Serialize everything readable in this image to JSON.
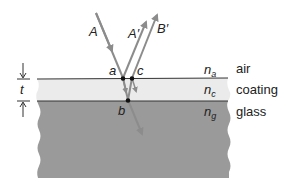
{
  "figure": {
    "rays": {
      "incident": "A",
      "reflected_top": "A′",
      "reflected_bottom": "B′"
    },
    "points": {
      "a": "a",
      "b": "b",
      "c": "c"
    },
    "thickness_label": "t",
    "layers": [
      {
        "name": "air",
        "index_symbol": "n",
        "index_subscript": "a"
      },
      {
        "name": "coating",
        "index_symbol": "n",
        "index_subscript": "c"
      },
      {
        "name": "glass",
        "index_symbol": "n",
        "index_subscript": "g"
      }
    ],
    "colors": {
      "coating_fill": "#ebebeb",
      "glass_fill": "#9a9a9a",
      "ray": "#8c8c8c",
      "interface_line": "#333333",
      "point": "#111111"
    }
  }
}
